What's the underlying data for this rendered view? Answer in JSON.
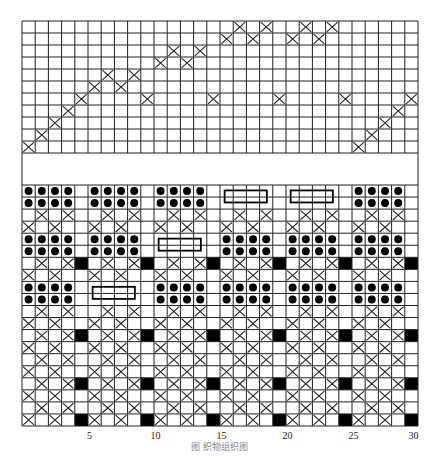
{
  "figure": {
    "caption": "图  织物组织图",
    "columns": 30,
    "x_axis_labels": [
      {
        "col": 5,
        "label": "5"
      },
      {
        "col": 10,
        "label": "10"
      },
      {
        "col": 15,
        "label": "15"
      },
      {
        "col": 20,
        "label": "20"
      },
      {
        "col": 25,
        "label": "25"
      },
      {
        "col": 30,
        "label": "30"
      }
    ],
    "colors": {
      "line": "#222222",
      "fill": "#000000",
      "background": "#ffffff"
    },
    "legend_symbols": {
      "X": "cross-mark",
      "D": "dot-mark",
      "B": "black-filled-cell",
      ".": "empty-cell",
      "bar": "rectangle-bar"
    }
  },
  "top_grid": {
    "rows": 11,
    "cells": [
      {
        "row": 1,
        "cols": [
          17,
          19,
          22,
          24
        ]
      },
      {
        "row": 2,
        "cols": [
          16,
          18,
          21,
          23
        ]
      },
      {
        "row": 3,
        "cols": [
          12,
          14
        ]
      },
      {
        "row": 4,
        "cols": [
          11,
          13
        ]
      },
      {
        "row": 5,
        "cols": [
          7,
          9
        ]
      },
      {
        "row": 6,
        "cols": [
          6,
          8
        ]
      },
      {
        "row": 7,
        "cols": [
          5,
          10,
          15,
          20,
          25,
          30
        ]
      },
      {
        "row": 8,
        "cols": [
          4,
          29
        ]
      },
      {
        "row": 9,
        "cols": [
          3,
          28
        ]
      },
      {
        "row": 10,
        "cols": [
          2,
          27
        ]
      },
      {
        "row": 11,
        "cols": [
          1,
          26
        ]
      }
    ]
  },
  "bottom_grid": {
    "rows": 20,
    "repeat_width": 5,
    "row_patterns": [
      "DDDD.",
      "DDDD.",
      ".X.X.",
      "X.X..",
      "DDDD.",
      "DDDD.",
      ".X.XB",
      "X.X..",
      "DDDD.",
      "DDDD.",
      ".X.X.",
      "X.X..",
      ".X.XB",
      "X.X..",
      ".X.X.",
      "X.X..",
      ".X.XB",
      "X.X..",
      ".X.X.",
      "X.X.B"
    ],
    "bars": [
      {
        "rows": [
          1,
          2
        ],
        "col_start": 16,
        "col_end": 19
      },
      {
        "rows": [
          1,
          2
        ],
        "col_start": 21,
        "col_end": 24
      },
      {
        "rows": [
          5,
          6
        ],
        "col_start": 11,
        "col_end": 14
      },
      {
        "rows": [
          9,
          10
        ],
        "col_start": 6,
        "col_end": 9
      }
    ],
    "bar_groups_without_dots": [
      {
        "rows": [
          1,
          2
        ],
        "cols": [
          16,
          17,
          18,
          19
        ]
      },
      {
        "rows": [
          1,
          2
        ],
        "cols": [
          21,
          22,
          23,
          24
        ]
      },
      {
        "rows": [
          5,
          6
        ],
        "cols": [
          11,
          12,
          13,
          14
        ]
      },
      {
        "rows": [
          9,
          10
        ],
        "cols": [
          6,
          7,
          8,
          9
        ]
      }
    ]
  }
}
